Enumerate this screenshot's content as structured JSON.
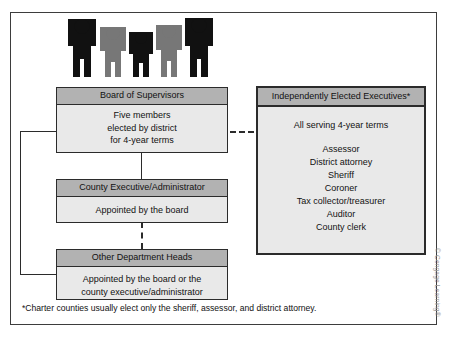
{
  "figure": {
    "people_icon": {
      "count": 5,
      "colors": [
        "#111111",
        "#777777",
        "#111111",
        "#777777",
        "#111111"
      ]
    },
    "footnote": "*Charter counties usually elect only the sheriff, assessor, and district attorney.",
    "credit": "© Cengage Learning®"
  },
  "boxes": {
    "board": {
      "title": "Board of Supervisors",
      "lines": [
        "Five members",
        "elected by district",
        "for 4-year terms"
      ]
    },
    "executive": {
      "title": "County Executive/Administrator",
      "lines": [
        "Appointed by the board"
      ]
    },
    "departments": {
      "title": "Other Department Heads",
      "lines": [
        "Appointed by the board or the",
        "county executive/administrator"
      ]
    },
    "elected": {
      "title": "Independently Elected Executives*",
      "lead": "All serving 4-year terms",
      "offices": [
        "Assessor",
        "District attorney",
        "Sheriff",
        "Coroner",
        "Tax collector/treasurer",
        "Auditor",
        "County clerk"
      ]
    }
  },
  "colors": {
    "header_fill": "#b2b2b2",
    "body_fill": "#e9e9e9",
    "line": "#2b2b2b",
    "frame": "#3d3d3d"
  }
}
